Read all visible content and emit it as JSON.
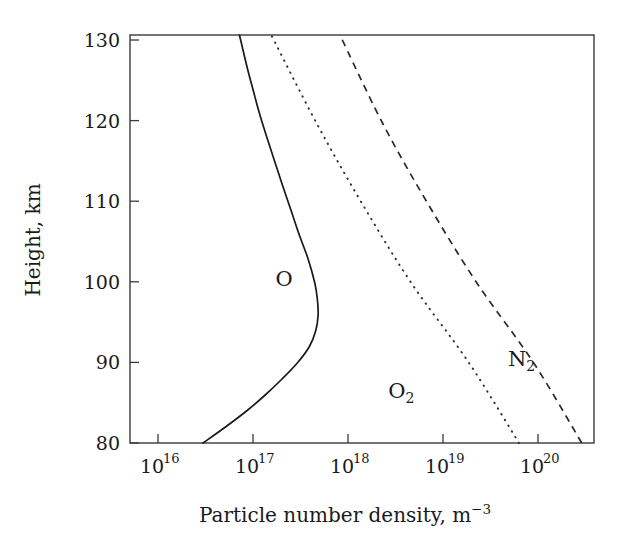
{
  "figure": {
    "title": "",
    "background_color": "#ffffff",
    "ink_color": "#1a1a1a"
  },
  "axes": {
    "x_title_main": "Particle number density, m",
    "x_title_exponent": "−3",
    "y_title": "Height, km",
    "x_tick_base": "10",
    "x_tick_exponents": [
      "16",
      "17",
      "18",
      "19",
      "20"
    ],
    "y_tick_labels": [
      "80",
      "90",
      "100",
      "110",
      "120",
      "130"
    ]
  },
  "chart_data": {
    "type": "line",
    "title": "",
    "xlabel": "Particle number density, m^-3",
    "ylabel": "Height, km",
    "xscale": "log",
    "xlim": [
      3160000000000000.0,
      7.2e+20
    ],
    "ylim": [
      80,
      131
    ],
    "grid": false,
    "legend": "inline-annotations",
    "x_ticks": [
      1e+16,
      1e+17,
      1e+18,
      1e+19,
      1e+20
    ],
    "x_tick_labels": [
      "10^16",
      "10^17",
      "10^18",
      "10^19",
      "10^20"
    ],
    "y_ticks": [
      80,
      90,
      100,
      110,
      120,
      130
    ],
    "series": [
      {
        "name": "O",
        "label": "O",
        "style": "solid",
        "color": "#1a1a1a",
        "label_position": {
          "x": 1.9e+17,
          "y": 100.5
        },
        "points": [
          {
            "height_km": 80,
            "density": 2.2e+16
          },
          {
            "height_km": 82,
            "density": 4e+16
          },
          {
            "height_km": 84,
            "density": 7e+16
          },
          {
            "height_km": 86,
            "density": 1.15e+17
          },
          {
            "height_km": 88,
            "density": 1.8e+17
          },
          {
            "height_km": 90,
            "density": 2.7e+17
          },
          {
            "height_km": 92,
            "density": 3.7e+17
          },
          {
            "height_km": 94,
            "density": 4.4e+17
          },
          {
            "height_km": 96,
            "density": 4.7e+17
          },
          {
            "height_km": 98,
            "density": 4.6e+17
          },
          {
            "height_km": 100,
            "density": 4.3e+17
          },
          {
            "height_km": 103,
            "density": 3.6e+17
          },
          {
            "height_km": 106,
            "density": 2.85e+17
          },
          {
            "height_km": 109,
            "density": 2.3e+17
          },
          {
            "height_km": 112,
            "density": 1.85e+17
          },
          {
            "height_km": 115,
            "density": 1.5e+17
          },
          {
            "height_km": 118,
            "density": 1.22e+17
          },
          {
            "height_km": 121,
            "density": 1e+17
          },
          {
            "height_km": 124,
            "density": 8.4e+16
          },
          {
            "height_km": 127,
            "density": 7.1e+16
          },
          {
            "height_km": 131,
            "density": 5.8e+16
          }
        ]
      },
      {
        "name": "O2",
        "label": "O₂",
        "style": "dotted",
        "color": "#2a2a2a",
        "label_position": {
          "x": 4.3e+18,
          "y": 86.5
        },
        "points": [
          {
            "height_km": 80,
            "density": 9.8e+19
          },
          {
            "height_km": 90,
            "density": 2.6e+19
          },
          {
            "height_km": 100,
            "density": 5.6e+18
          },
          {
            "height_km": 110,
            "density": 1.5e+18
          },
          {
            "height_km": 120,
            "density": 4.5e+17
          },
          {
            "height_km": 131,
            "density": 1.35e+17
          }
        ]
      },
      {
        "name": "N2",
        "label": "N₂",
        "style": "dashed",
        "color": "#2a2a2a",
        "label_position": {
          "x": 1.05e+20,
          "y": 90.5
        },
        "points": [
          {
            "height_km": 80,
            "density": 5.2e+20
          },
          {
            "height_km": 90,
            "density": 1.45e+20
          },
          {
            "height_km": 100,
            "density": 3.2e+19
          },
          {
            "height_km": 110,
            "density": 8.6e+18
          },
          {
            "height_km": 120,
            "density": 2.6e+18
          },
          {
            "height_km": 131,
            "density": 8.4e+17
          }
        ]
      }
    ],
    "annotations": [
      {
        "text": "O",
        "x": 1.9e+17,
        "y": 100.5
      },
      {
        "text": "O2",
        "x": 4.3e+18,
        "y": 86.5
      },
      {
        "text": "N2",
        "x": 1.05e+20,
        "y": 90.5
      }
    ]
  }
}
